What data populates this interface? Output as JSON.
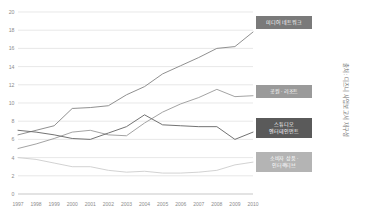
{
  "source_note": "출처: 디즈니 사업보고서 재구성",
  "axes": {
    "y_ticks": [
      0,
      2,
      4,
      6,
      8,
      10,
      12,
      14,
      16,
      18,
      20
    ],
    "y_min": 0,
    "y_max": 20,
    "x_ticks": [
      "1997",
      "1998",
      "1999",
      "2000",
      "2001",
      "2002",
      "2003",
      "2004",
      "2005",
      "2006",
      "2007",
      "2008",
      "2009",
      "2010"
    ]
  },
  "legend_boxes": [
    {
      "label": "미디어 네트워크",
      "color": "#7a7a7a"
    },
    {
      "label": "공원 · 리조트",
      "color": "#9a9a9a"
    },
    {
      "label": "스튜디오\n엔터테인먼트",
      "color": "#5a5a5a"
    },
    {
      "label": "소비자 상품 ·\n인터랙티브",
      "color": "#b4b4b4"
    }
  ],
  "chart_data": {
    "type": "line",
    "title": "",
    "xlabel": "",
    "ylabel": "",
    "ylim": [
      0,
      20
    ],
    "grid": true,
    "legend_position": "inline-right",
    "categories": [
      "1997",
      "1998",
      "1999",
      "2000",
      "2001",
      "2002",
      "2003",
      "2004",
      "2005",
      "2006",
      "2007",
      "2008",
      "2009",
      "2010"
    ],
    "series": [
      {
        "name": "미디어 네트워크",
        "color": "#8a8a8a",
        "values": [
          6.5,
          7.0,
          7.5,
          9.4,
          9.5,
          9.7,
          10.9,
          11.8,
          13.2,
          14.1,
          15.0,
          16.0,
          16.2,
          17.8
        ]
      },
      {
        "name": "공원 · 리조트",
        "color": "#9e9e9e",
        "values": [
          5.0,
          5.5,
          6.1,
          6.8,
          7.0,
          6.5,
          6.4,
          7.8,
          9.0,
          9.9,
          10.6,
          11.5,
          10.7,
          10.8
        ]
      },
      {
        "name": "스튜디오 엔터테인먼트",
        "color": "#6a6a6a",
        "values": [
          7.0,
          6.8,
          6.5,
          6.1,
          6.0,
          6.7,
          7.4,
          8.7,
          7.6,
          7.5,
          7.4,
          7.4,
          6.0,
          6.8
        ]
      },
      {
        "name": "소비자 상품 · 인터랙티브",
        "color": "#d0d0d0",
        "values": [
          4.0,
          3.8,
          3.4,
          3.0,
          3.0,
          2.6,
          2.4,
          2.5,
          2.3,
          2.3,
          2.4,
          2.6,
          3.2,
          3.5
        ]
      }
    ]
  }
}
